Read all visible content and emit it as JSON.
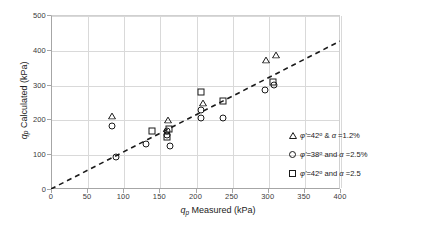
{
  "chart_data": {
    "type": "scatter",
    "title": "",
    "xlabel": "q_p Measured (kPa)",
    "ylabel": "q_p Calculated (kPa)",
    "xlabel_parts": {
      "q": "q",
      "sub": "p",
      "rest": " Measured (kPa)"
    },
    "ylabel_parts": {
      "q": "q",
      "sub": "p",
      "rest": " Calculated (kPa)"
    },
    "xlim": [
      0,
      400
    ],
    "ylim": [
      0,
      500
    ],
    "xticks": [
      0,
      50,
      100,
      150,
      200,
      250,
      300,
      350,
      400
    ],
    "yticks": [
      0,
      100,
      200,
      300,
      400,
      500
    ],
    "grid": true,
    "legend_position": "lower-right",
    "reference_line": {
      "label": "1:1 line",
      "style": "dashed",
      "color": "#1a1a1a",
      "x": [
        0,
        400
      ],
      "y": [
        0,
        425
      ]
    },
    "series": [
      {
        "name": "phi'=42 deg & alpha =1.2%",
        "marker": "triangle",
        "color": "#1a1a1a",
        "points": [
          {
            "x": 85,
            "y": 230
          },
          {
            "x": 162,
            "y": 218
          },
          {
            "x": 210,
            "y": 268
          },
          {
            "x": 298,
            "y": 390
          },
          {
            "x": 311,
            "y": 405
          }
        ]
      },
      {
        "name": "phi'=38 deg and alpha =2.5%",
        "marker": "circle",
        "color": "#1a1a1a",
        "points": [
          {
            "x": 85,
            "y": 180
          },
          {
            "x": 90,
            "y": 92
          },
          {
            "x": 132,
            "y": 128
          },
          {
            "x": 160,
            "y": 168
          },
          {
            "x": 160,
            "y": 155
          },
          {
            "x": 165,
            "y": 125
          },
          {
            "x": 208,
            "y": 228
          },
          {
            "x": 208,
            "y": 205
          },
          {
            "x": 238,
            "y": 205
          },
          {
            "x": 296,
            "y": 285
          },
          {
            "x": 308,
            "y": 300
          }
        ]
      },
      {
        "name": "phi'=42 deg and alpha =2.5",
        "marker": "square",
        "color": "#1a1a1a",
        "points": [
          {
            "x": 140,
            "y": 168
          },
          {
            "x": 163,
            "y": 172
          },
          {
            "x": 160,
            "y": 150
          },
          {
            "x": 208,
            "y": 280
          },
          {
            "x": 238,
            "y": 252
          },
          {
            "x": 307,
            "y": 308
          }
        ]
      }
    ]
  },
  "legend": {
    "entries": [
      {
        "marker": "triangle",
        "phi_label": "φ",
        "prime": "'",
        "eq": "=42",
        "deg": "o",
        "conj": "&",
        "alpha": "α",
        "alpha_val": "=1.2%",
        "full": "φ' =42° & α =1.2%"
      },
      {
        "marker": "circle",
        "phi_label": "φ",
        "prime": "'",
        "eq": "=38",
        "deg": "o",
        "conj": "and",
        "alpha": "α",
        "alpha_val": "=2.5%",
        "full": "φ' =38° and α =2.5%"
      },
      {
        "marker": "square",
        "phi_label": "φ",
        "prime": "'",
        "eq": "=42",
        "deg": "o",
        "conj": "and",
        "alpha": "α",
        "alpha_val": "=2.5",
        "full": "φ' =42° and α =2.5"
      }
    ]
  },
  "axes": {
    "x_tick_labels": [
      "0",
      "50",
      "100",
      "150",
      "200",
      "250",
      "300",
      "350",
      "400"
    ],
    "y_tick_labels": [
      "0",
      "100",
      "200",
      "300",
      "400",
      "500"
    ]
  }
}
